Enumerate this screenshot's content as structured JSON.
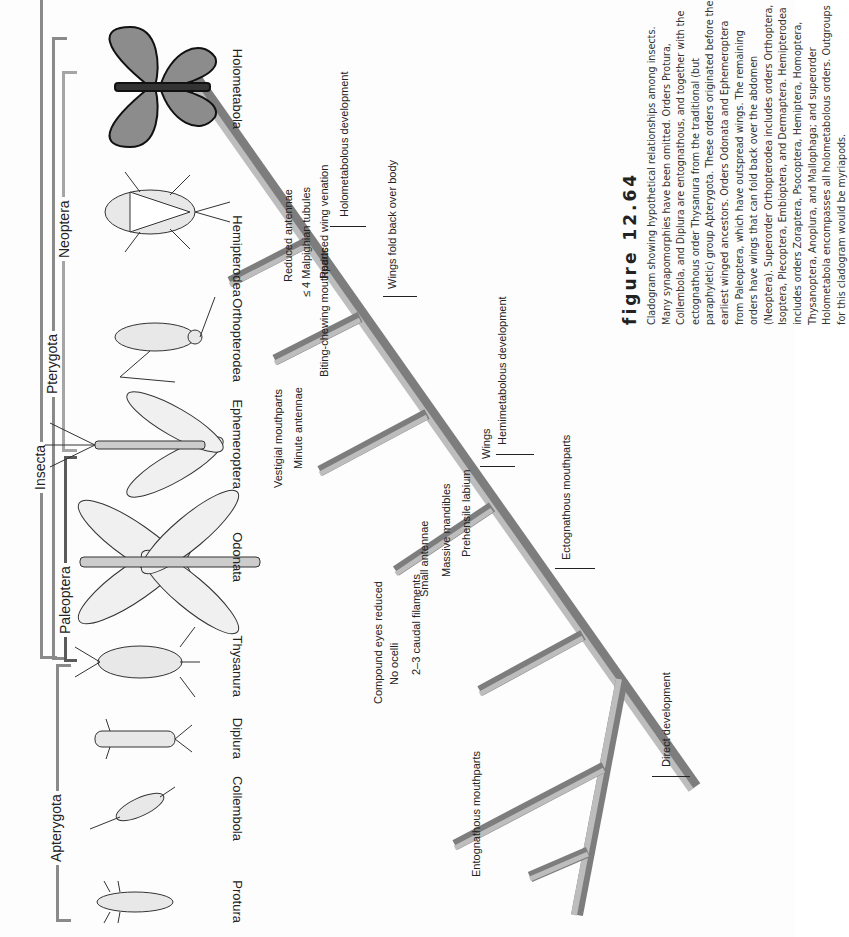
{
  "figure": {
    "label": "figure 12.64",
    "caption": "Cladogram showing hypothetical relationships among insects. Many synapomorphies have been omitted. Orders Protura, Collembola, and Diplura are entognathous, and together with the ectognathous order Thysanura from the traditional (but paraphyletic) group Apterygota. These orders originated before the earliest winged ancestors. Orders Odonata and Ephemeroptera from Paleoptera, which have outspread wings. The remaining orders have wings that can fold back over the abdomen (Neoptera). Superorder Orthopterodea includes orders Orthoptera, Isoptera, Plecoptera, Embioptera, and Dermaptera. Hemipterodea includes orders Zoraptera, Psocoptera, Hemiptera, Homoptera, Thysanoptera, Anoplura, and Mallophaga; and superorder Holometabola encompasses all holometabolous orders. Outgroups for this cladogram would be myriapods."
  },
  "clades": {
    "insecta": "Insecta",
    "apterygota": "Apterygota",
    "pterygota": "Pterygota",
    "paleoptera": "Paleoptera",
    "neoptera": "Neoptera"
  },
  "taxa": [
    {
      "name": "Protura",
      "icon": "proturan-icon"
    },
    {
      "name": "Collembola",
      "icon": "springtail-icon"
    },
    {
      "name": "Diplura",
      "icon": "dipluran-icon"
    },
    {
      "name": "Thysanura",
      "icon": "silverfish-icon"
    },
    {
      "name": "Odonata",
      "icon": "dragonfly-icon"
    },
    {
      "name": "Ephemeroptera",
      "icon": "mayfly-icon"
    },
    {
      "name": "Orthopterodea",
      "icon": "grasshopper-icon"
    },
    {
      "name": "Hemipterodea",
      "icon": "true-bug-icon"
    },
    {
      "name": "Holometabola",
      "icon": "butterfly-icon"
    }
  ],
  "characters": {
    "trunk": [
      "Direct development",
      "Ectognathous mouthparts",
      "Wings",
      "Hemimetabolous development",
      "Wings fold back over body",
      "Holometabolous development"
    ],
    "entognatha": [
      "Entognathous mouthparts"
    ],
    "thysanura": [
      "Compound eyes reduced",
      "No ocelli",
      "2–3 caudal filaments"
    ],
    "odonata": [
      "Small antennae",
      "Massive mandibles",
      "Prehensile labium"
    ],
    "ephemeroptera": [
      "Vestigial mouthparts",
      "Minute antennae"
    ],
    "orthopterodea": [
      "Biting-chewing mouthparts"
    ],
    "hemipterodea": [
      "Reduced antennae",
      "≤ 4 Malpighian tubules",
      "Reduced wing venation"
    ]
  },
  "colors": {
    "branch_light": "#b5b5b5",
    "branch_dark": "#7d7d7d",
    "bracket": "#8a8a8a",
    "text": "#222222"
  }
}
